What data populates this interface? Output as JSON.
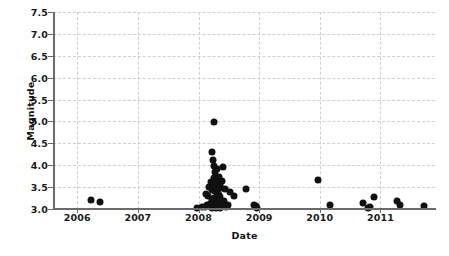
{
  "chart_data": {
    "type": "scatter",
    "title": "",
    "xlabel": "Date",
    "ylabel": "Magnitude",
    "xlim": [
      2005.6,
      2011.9
    ],
    "ylim": [
      3.0,
      7.5
    ],
    "grid": true,
    "legend": null,
    "marker": {
      "shape": "circle",
      "color": "#111111",
      "size_px": 7
    },
    "x_ticks": [
      2006,
      2007,
      2008,
      2009,
      2010,
      2011
    ],
    "x_tick_labels": [
      "2006",
      "2007",
      "2008",
      "2009",
      "2010",
      "2011"
    ],
    "y_ticks": [
      3.0,
      3.5,
      4.0,
      4.5,
      5.0,
      5.5,
      6.0,
      6.5,
      7.0,
      7.5
    ],
    "y_tick_labels": [
      "3.0",
      "3.5",
      "4.0",
      "4.5",
      "5.0",
      "5.5",
      "6.0",
      "6.5",
      "7.0",
      "7.5"
    ],
    "n_points": 72,
    "points": [
      {
        "x": 2006.22,
        "y": 3.21
      },
      {
        "x": 2006.37,
        "y": 3.16
      },
      {
        "x": 2007.97,
        "y": 3.02
      },
      {
        "x": 2008.05,
        "y": 3.04
      },
      {
        "x": 2008.1,
        "y": 3.05
      },
      {
        "x": 2008.13,
        "y": 3.34
      },
      {
        "x": 2008.14,
        "y": 3.08
      },
      {
        "x": 2008.16,
        "y": 3.3
      },
      {
        "x": 2008.17,
        "y": 3.06
      },
      {
        "x": 2008.18,
        "y": 3.5
      },
      {
        "x": 2008.19,
        "y": 3.12
      },
      {
        "x": 2008.2,
        "y": 3.62
      },
      {
        "x": 2008.21,
        "y": 3.09
      },
      {
        "x": 2008.22,
        "y": 3.44
      },
      {
        "x": 2008.22,
        "y": 3.03
      },
      {
        "x": 2008.23,
        "y": 4.3
      },
      {
        "x": 2008.23,
        "y": 3.2
      },
      {
        "x": 2008.24,
        "y": 4.12
      },
      {
        "x": 2008.24,
        "y": 3.57
      },
      {
        "x": 2008.25,
        "y": 3.98
      },
      {
        "x": 2008.25,
        "y": 3.26
      },
      {
        "x": 2008.25,
        "y": 3.07
      },
      {
        "x": 2008.26,
        "y": 4.99
      },
      {
        "x": 2008.26,
        "y": 3.7
      },
      {
        "x": 2008.26,
        "y": 3.15
      },
      {
        "x": 2008.27,
        "y": 3.84
      },
      {
        "x": 2008.27,
        "y": 3.4
      },
      {
        "x": 2008.27,
        "y": 3.05
      },
      {
        "x": 2008.28,
        "y": 3.66
      },
      {
        "x": 2008.28,
        "y": 3.24
      },
      {
        "x": 2008.28,
        "y": 3.02
      },
      {
        "x": 2008.29,
        "y": 3.53
      },
      {
        "x": 2008.29,
        "y": 3.18
      },
      {
        "x": 2008.3,
        "y": 3.92
      },
      {
        "x": 2008.3,
        "y": 3.36
      },
      {
        "x": 2008.3,
        "y": 3.06
      },
      {
        "x": 2008.31,
        "y": 3.6
      },
      {
        "x": 2008.31,
        "y": 3.13
      },
      {
        "x": 2008.32,
        "y": 3.46
      },
      {
        "x": 2008.32,
        "y": 3.04
      },
      {
        "x": 2008.33,
        "y": 3.72
      },
      {
        "x": 2008.33,
        "y": 3.22
      },
      {
        "x": 2008.34,
        "y": 3.33
      },
      {
        "x": 2008.34,
        "y": 3.08
      },
      {
        "x": 2008.35,
        "y": 3.56
      },
      {
        "x": 2008.35,
        "y": 3.1
      },
      {
        "x": 2008.36,
        "y": 3.28
      },
      {
        "x": 2008.36,
        "y": 3.03
      },
      {
        "x": 2008.37,
        "y": 3.49
      },
      {
        "x": 2008.38,
        "y": 3.14
      },
      {
        "x": 2008.39,
        "y": 3.64
      },
      {
        "x": 2008.4,
        "y": 3.06
      },
      {
        "x": 2008.41,
        "y": 3.96
      },
      {
        "x": 2008.42,
        "y": 3.19
      },
      {
        "x": 2008.44,
        "y": 3.45
      },
      {
        "x": 2008.46,
        "y": 3.05
      },
      {
        "x": 2008.48,
        "y": 3.09
      },
      {
        "x": 2008.52,
        "y": 3.38
      },
      {
        "x": 2008.58,
        "y": 3.29
      },
      {
        "x": 2008.78,
        "y": 3.45
      },
      {
        "x": 2008.92,
        "y": 3.08
      },
      {
        "x": 2008.95,
        "y": 3.06
      },
      {
        "x": 2008.97,
        "y": 3.03
      },
      {
        "x": 2009.97,
        "y": 3.67
      },
      {
        "x": 2010.17,
        "y": 3.09
      },
      {
        "x": 2010.72,
        "y": 3.13
      },
      {
        "x": 2010.8,
        "y": 3.02
      },
      {
        "x": 2010.82,
        "y": 3.04
      },
      {
        "x": 2010.9,
        "y": 3.27
      },
      {
        "x": 2011.28,
        "y": 3.18
      },
      {
        "x": 2011.33,
        "y": 3.09
      },
      {
        "x": 2011.72,
        "y": 3.06
      }
    ]
  },
  "colors": {
    "marker": "#111111",
    "axis": "#6b6b6b",
    "grid": "#cfcfcf",
    "text": "#111111",
    "background": "#ffffff"
  }
}
